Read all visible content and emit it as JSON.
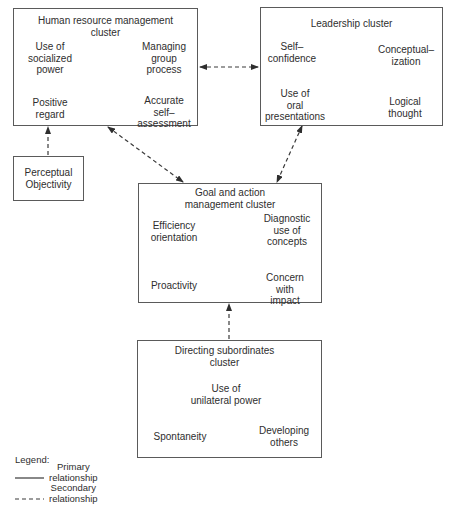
{
  "clusters": {
    "hr": {
      "title": "Human resource management\ncluster",
      "nodes": {
        "tl": "Use of\nsocialized\npower",
        "tr": "Managing\ngroup\nprocess",
        "bl": "Positive\nregard",
        "br": "Accurate\nself–\nassessment"
      }
    },
    "leadership": {
      "title": "Leadership cluster",
      "nodes": {
        "tl": "Self–\nconfidence",
        "tr": "Conceptual–\nization",
        "bl": "Use of\noral\npresentations",
        "br": "Logical\nthought"
      }
    },
    "perceptual": {
      "title": "Perceptual\nObjectivity"
    },
    "goal": {
      "title": "Goal and action\nmanagement cluster",
      "nodes": {
        "tl": "Efficiency\norientation",
        "tr": "Diagnostic\nuse of\nconcepts",
        "bl": "Proactivity",
        "br": "Concern\nwith\nimpact"
      }
    },
    "directing": {
      "title": "Directing subordinates\ncluster",
      "nodes": {
        "top": "Use of\nunilateral power",
        "bl": "Spontaneity",
        "br": "Developing\nothers"
      }
    }
  },
  "legend": {
    "label": "Legend:",
    "primary": "Primary\nrelationship",
    "secondary": "Secondary\nrelationship"
  },
  "colors": {
    "line": "#3a3a3a",
    "border": "#5a5a5a",
    "text": "#2e2e2e"
  }
}
